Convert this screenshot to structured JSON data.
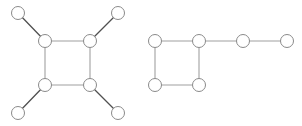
{
  "diagram": {
    "type": "graph",
    "colors": {
      "background": "#ffffff",
      "node_fill": "#ffffff",
      "node_stroke": "#8a8a8a",
      "edge_square": "#a0a0a0",
      "edge_spoke": "#505050"
    },
    "node_radius": 6.5,
    "graphs": [
      {
        "name": "square-with-four-pendants",
        "nodes": [
          {
            "id": "a1",
            "x": 45,
            "y": 41
          },
          {
            "id": "a2",
            "x": 90,
            "y": 41
          },
          {
            "id": "a3",
            "x": 45,
            "y": 85
          },
          {
            "id": "a4",
            "x": 90,
            "y": 85
          },
          {
            "id": "a5",
            "x": 18,
            "y": 13
          },
          {
            "id": "a6",
            "x": 118,
            "y": 13
          },
          {
            "id": "a7",
            "x": 18,
            "y": 113
          },
          {
            "id": "a8",
            "x": 118,
            "y": 113
          }
        ],
        "edges": [
          {
            "from": "a1",
            "to": "a2",
            "kind": "square"
          },
          {
            "from": "a1",
            "to": "a3",
            "kind": "square"
          },
          {
            "from": "a2",
            "to": "a4",
            "kind": "square"
          },
          {
            "from": "a3",
            "to": "a4",
            "kind": "square"
          },
          {
            "from": "a1",
            "to": "a5",
            "kind": "spoke"
          },
          {
            "from": "a2",
            "to": "a6",
            "kind": "spoke"
          },
          {
            "from": "a3",
            "to": "a7",
            "kind": "spoke"
          },
          {
            "from": "a4",
            "to": "a8",
            "kind": "spoke"
          }
        ]
      },
      {
        "name": "square-with-tail",
        "nodes": [
          {
            "id": "b1",
            "x": 155,
            "y": 41
          },
          {
            "id": "b2",
            "x": 199,
            "y": 41
          },
          {
            "id": "b3",
            "x": 155,
            "y": 85
          },
          {
            "id": "b4",
            "x": 199,
            "y": 85
          },
          {
            "id": "b5",
            "x": 243,
            "y": 41
          },
          {
            "id": "b6",
            "x": 287,
            "y": 41
          }
        ],
        "edges": [
          {
            "from": "b1",
            "to": "b2",
            "kind": "square"
          },
          {
            "from": "b1",
            "to": "b3",
            "kind": "square"
          },
          {
            "from": "b2",
            "to": "b4",
            "kind": "square"
          },
          {
            "from": "b3",
            "to": "b4",
            "kind": "square"
          },
          {
            "from": "b2",
            "to": "b5",
            "kind": "square"
          },
          {
            "from": "b5",
            "to": "b6",
            "kind": "square"
          }
        ]
      }
    ]
  }
}
